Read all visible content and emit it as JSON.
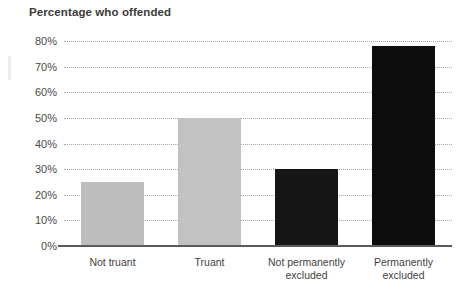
{
  "chart_data": {
    "type": "bar",
    "title": "Percentage who offended",
    "xlabel": "",
    "ylabel": "",
    "categories": [
      "Not truant",
      "Truant",
      "Not permanently excluded",
      "Permanently excluded"
    ],
    "category_lines": [
      [
        "Not truant"
      ],
      [
        "Truant"
      ],
      [
        "Not permanently",
        "excluded"
      ],
      [
        "Permanently",
        "excluded"
      ]
    ],
    "values": [
      25,
      50,
      30,
      78
    ],
    "value_labels": [
      "25%",
      "50%",
      "30%",
      "78%"
    ],
    "bar_colors": [
      "#bdbdbd",
      "#c2c2c2",
      "#151515",
      "#0c0c0c"
    ],
    "ylim": [
      0,
      80
    ],
    "y_ticks": [
      0,
      10,
      20,
      30,
      40,
      50,
      60,
      70,
      80
    ],
    "y_tick_labels": [
      "0%",
      "10%",
      "20%",
      "30%",
      "40%",
      "50%",
      "60%",
      "70%",
      "80%"
    ],
    "grid": true,
    "grid_style": "dotted",
    "legend": null,
    "legend_position": "none"
  },
  "axis": {
    "baseline_color": "#5b5b5b",
    "gridline_color": "#9a9a9a"
  },
  "figure": {
    "background": "#ffffff",
    "title_color": "#3a3a3a"
  }
}
